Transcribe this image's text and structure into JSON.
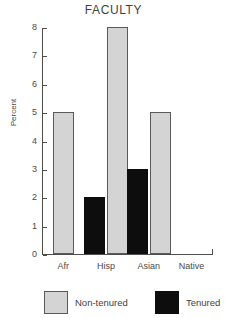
{
  "chart_data": {
    "type": "bar",
    "title": "FACULTY",
    "xlabel": "",
    "ylabel": "Percent",
    "categories": [
      "Afr",
      "Hisp",
      "Asian",
      "Native"
    ],
    "series": [
      {
        "name": "Non-tenured",
        "color": "#d4d4d4",
        "values": [
          5,
          8,
          5,
          0
        ]
      },
      {
        "name": "Tenured",
        "color": "#0d0d0d",
        "values": [
          0,
          2,
          3,
          0
        ]
      }
    ],
    "ylim": [
      0,
      8
    ],
    "yticks": [
      8,
      7,
      6,
      5,
      4,
      3,
      2,
      1,
      0
    ],
    "ytick_labels": [
      "8",
      "7",
      "6",
      "5",
      "4",
      "3",
      "2",
      "1",
      "0"
    ],
    "grid": false,
    "legend_position": "bottom"
  },
  "legend": {
    "items": [
      {
        "label": "Non-tenured",
        "swatch": "nontenured"
      },
      {
        "label": "Tenured",
        "swatch": "tenured"
      }
    ]
  }
}
